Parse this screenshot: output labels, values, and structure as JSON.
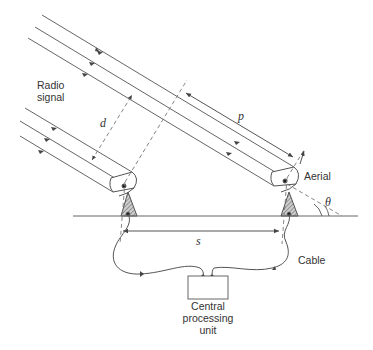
{
  "diagram": {
    "type": "radio interferometer schematic",
    "labels": {
      "radio_signal_line1": "Radio",
      "radio_signal_line2": "signal",
      "aerial": "Aerial",
      "cable": "Cable",
      "cpu_line1": "Central",
      "cpu_line2": "processing",
      "cpu_line3": "unit"
    },
    "variables": {
      "d": "d",
      "p": "p",
      "s": "s",
      "theta": "θ"
    },
    "colors": {
      "line": "#555555",
      "hatch": "#777777",
      "background": "#ffffff"
    }
  }
}
